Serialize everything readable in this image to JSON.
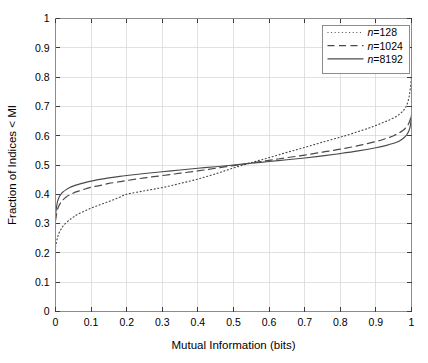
{
  "chart_data": {
    "type": "line",
    "title": "",
    "xlabel": "Mutual Information (bits)",
    "ylabel": "Fraction of Indices < MI",
    "xlim": [
      0,
      1
    ],
    "ylim": [
      0,
      1
    ],
    "grid": true,
    "legend_position": "top-right",
    "xticks": [
      "0",
      "0.1",
      "0.2",
      "0.3",
      "0.4",
      "0.5",
      "0.6",
      "0.7",
      "0.8",
      "0.9",
      "1"
    ],
    "xtick_values": [
      0,
      0.1,
      0.2,
      0.3,
      0.4,
      0.5,
      0.6,
      0.7,
      0.8,
      0.9,
      1
    ],
    "yticks": [
      "0",
      "0.1",
      "0.2",
      "0.3",
      "0.4",
      "0.5",
      "0.6",
      "0.7",
      "0.8",
      "0.9",
      "1"
    ],
    "ytick_values": [
      0,
      0.1,
      0.2,
      0.3,
      0.4,
      0.5,
      0.6,
      0.7,
      0.8,
      0.9,
      1
    ],
    "line_color": "#4a4a4a",
    "grid_color": "#d4d4d4",
    "axis_color": "#8c8c8c",
    "series": [
      {
        "name": "n=128",
        "name_prefix": "n",
        "name_suffix": "=128",
        "style": "dotted",
        "x": [
          0.0,
          0.005,
          0.01,
          0.015,
          0.02,
          0.03,
          0.04,
          0.05,
          0.06,
          0.08,
          0.1,
          0.12,
          0.14,
          0.16,
          0.18,
          0.2,
          0.25,
          0.3,
          0.35,
          0.4,
          0.45,
          0.5,
          0.55,
          0.6,
          0.65,
          0.7,
          0.75,
          0.8,
          0.82,
          0.85,
          0.88,
          0.9,
          0.92,
          0.94,
          0.96,
          0.975,
          0.985,
          0.992,
          0.996,
          1.0
        ],
        "y": [
          0.22,
          0.25,
          0.268,
          0.28,
          0.29,
          0.303,
          0.313,
          0.322,
          0.33,
          0.342,
          0.353,
          0.362,
          0.371,
          0.38,
          0.39,
          0.4,
          0.412,
          0.423,
          0.437,
          0.452,
          0.47,
          0.49,
          0.508,
          0.525,
          0.543,
          0.56,
          0.578,
          0.595,
          0.602,
          0.614,
          0.626,
          0.635,
          0.645,
          0.655,
          0.668,
          0.683,
          0.7,
          0.725,
          0.755,
          0.8
        ]
      },
      {
        "name": "n=1024",
        "name_prefix": "n",
        "name_suffix": "=1024",
        "style": "dashed",
        "x": [
          0.0,
          0.005,
          0.01,
          0.015,
          0.02,
          0.03,
          0.04,
          0.05,
          0.06,
          0.08,
          0.1,
          0.12,
          0.15,
          0.18,
          0.2,
          0.25,
          0.3,
          0.35,
          0.4,
          0.45,
          0.5,
          0.55,
          0.6,
          0.65,
          0.7,
          0.75,
          0.8,
          0.85,
          0.9,
          0.93,
          0.95,
          0.97,
          0.98,
          0.99,
          0.995,
          1.0
        ],
        "y": [
          0.31,
          0.345,
          0.362,
          0.372,
          0.38,
          0.391,
          0.398,
          0.404,
          0.409,
          0.417,
          0.424,
          0.429,
          0.437,
          0.443,
          0.447,
          0.456,
          0.464,
          0.472,
          0.48,
          0.489,
          0.498,
          0.507,
          0.516,
          0.525,
          0.534,
          0.544,
          0.554,
          0.566,
          0.58,
          0.591,
          0.6,
          0.613,
          0.622,
          0.637,
          0.65,
          0.672
        ]
      },
      {
        "name": "n=8192",
        "name_prefix": "n",
        "name_suffix": "=8192",
        "style": "solid",
        "x": [
          0.0,
          0.005,
          0.01,
          0.015,
          0.02,
          0.03,
          0.04,
          0.05,
          0.06,
          0.08,
          0.1,
          0.12,
          0.15,
          0.18,
          0.2,
          0.25,
          0.3,
          0.35,
          0.4,
          0.45,
          0.5,
          0.55,
          0.6,
          0.65,
          0.7,
          0.75,
          0.8,
          0.85,
          0.9,
          0.93,
          0.95,
          0.965,
          0.978,
          0.987,
          0.993,
          0.997,
          1.0
        ],
        "y": [
          0.33,
          0.372,
          0.39,
          0.4,
          0.407,
          0.416,
          0.423,
          0.428,
          0.432,
          0.439,
          0.445,
          0.45,
          0.456,
          0.461,
          0.464,
          0.471,
          0.477,
          0.483,
          0.489,
          0.494,
          0.5,
          0.506,
          0.512,
          0.518,
          0.524,
          0.531,
          0.539,
          0.548,
          0.559,
          0.567,
          0.574,
          0.581,
          0.592,
          0.604,
          0.618,
          0.635,
          0.672
        ]
      }
    ]
  }
}
